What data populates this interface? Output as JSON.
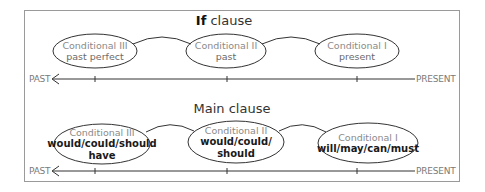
{
  "if_section": {
    "title_bold": "If",
    "title_rest": "clause",
    "ellipses": [
      {
        "name": "Conditional III",
        "tense": "past perfect"
      },
      {
        "name": "Conditional II",
        "tense": "past"
      },
      {
        "name": "Conditional I",
        "tense": "present"
      }
    ],
    "axis": {
      "left_label": "PAST",
      "right_label": "PRESENT"
    }
  },
  "main_section": {
    "title": "Main clause",
    "ellipses": [
      {
        "name": "Conditional III",
        "modal_line1": "would/could/should",
        "modal_line2": "have"
      },
      {
        "name": "Conditional II",
        "modal_line1": "would/could/",
        "modal_line2": "should"
      },
      {
        "name": "Conditional I",
        "modal_line1": "will/may/can/must",
        "modal_line2": ""
      }
    ],
    "axis": {
      "left_label": "PAST",
      "right_label": "PRESENT"
    }
  },
  "colors": {
    "line": "#333333",
    "frame": "#9a9a9a",
    "label_gray": "#8a8a8a",
    "bold_text": "#1a1a1a"
  }
}
